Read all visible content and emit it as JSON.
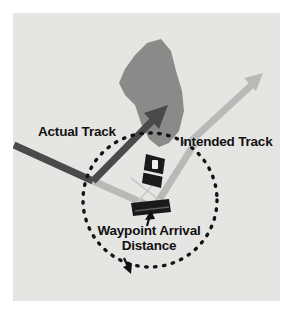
{
  "figure": {
    "name": "waypoint-arrival-distance-diagram",
    "background_color": "#e8e8e6",
    "frame_color": "#ffffff"
  },
  "labels": {
    "actual_track": "Actual Track",
    "intended_track": "Intended Track",
    "waypoint_arrival_line1": "Waypoint Arrival",
    "waypoint_arrival_line2": "Distance"
  },
  "icons": {
    "aircraft_upper": "aircraft-symbol-upper",
    "aircraft_lower": "aircraft-symbol-lower",
    "weather_cell": "weather-cell-polygon",
    "actual_track_arrow": "actual-track-arrow",
    "intended_track_arrow": "intended-track-arrow",
    "arrival_circle": "waypoint-arrival-circle",
    "pointer_to_waypoint": "pointer-arrow-to-waypoint",
    "pointer_to_circle": "pointer-arrow-to-circle"
  },
  "colors": {
    "dark_track": "#4a4a4a",
    "light_track": "#b9b9b7",
    "weather_cell": "#8a8a88",
    "dashed_circle": "#131313",
    "aircraft": "#1a1a1a",
    "text": "#111111"
  },
  "geometry": {
    "circle_center_x": 137,
    "circle_center_y": 187,
    "circle_radius": 67,
    "actual_track_heading_deg": 52,
    "intended_track_heading_deg": 40
  }
}
